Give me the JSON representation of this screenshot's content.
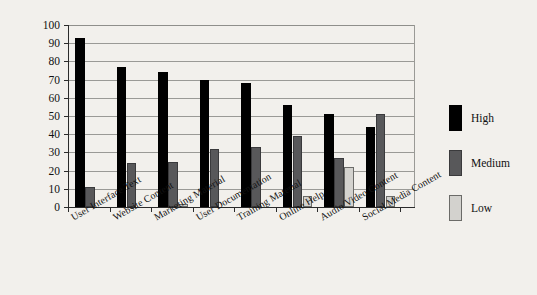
{
  "chart_data": {
    "type": "bar",
    "title": "",
    "xlabel": "",
    "ylabel": "",
    "ylim": [
      0,
      100
    ],
    "yticks": [
      0,
      10,
      20,
      30,
      40,
      50,
      60,
      70,
      80,
      90,
      100
    ],
    "grid": true,
    "legend_position": "right",
    "categories": [
      "User Interface Text",
      "Website Content",
      "Marketing Material",
      "User Documentation",
      "Training Material",
      "Online Help",
      "Audio/Video Content",
      "Social Media Content"
    ],
    "series": [
      {
        "name": "High",
        "color": "#000000",
        "values": [
          93,
          77,
          74,
          70,
          68,
          56,
          51,
          44
        ]
      },
      {
        "name": "Medium",
        "color": "#58585a",
        "values": [
          11,
          24,
          25,
          32,
          33,
          39,
          27,
          51
        ]
      },
      {
        "name": "Low",
        "color": "#d3d2ce",
        "values": [
          0,
          0,
          1.5,
          0,
          0,
          6,
          22,
          6
        ]
      }
    ]
  },
  "axis": {
    "y_tick_labels": [
      "100",
      "90",
      "80",
      "70",
      "60",
      "50",
      "40",
      "30",
      "20",
      "10",
      "0"
    ]
  },
  "legend": {
    "items": [
      {
        "label": "High",
        "color": "#000000"
      },
      {
        "label": "Medium",
        "color": "#58585a"
      },
      {
        "label": "Low",
        "color": "#d3d2ce"
      }
    ]
  }
}
